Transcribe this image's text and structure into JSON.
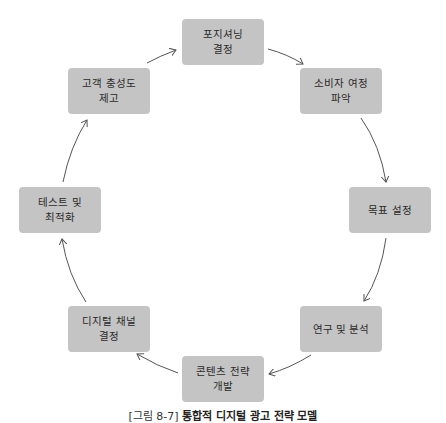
{
  "diagram": {
    "type": "cycle",
    "nodes": [
      {
        "id": "n0",
        "label": "포지셔닝\n결정"
      },
      {
        "id": "n1",
        "label": "소비자 여정\n파악"
      },
      {
        "id": "n2",
        "label": "목표 설정"
      },
      {
        "id": "n3",
        "label": "연구 및 분석"
      },
      {
        "id": "n4",
        "label": "콘텐츠 전략\n개발"
      },
      {
        "id": "n5",
        "label": "디지털 채널\n결정"
      },
      {
        "id": "n6",
        "label": "테스트 및\n최적화"
      },
      {
        "id": "n7",
        "label": "고객 충성도\n제고"
      }
    ],
    "edges": [
      {
        "from": "n7",
        "to": "n0"
      },
      {
        "from": "n0",
        "to": "n1"
      },
      {
        "from": "n1",
        "to": "n2"
      },
      {
        "from": "n2",
        "to": "n3"
      },
      {
        "from": "n3",
        "to": "n4"
      },
      {
        "from": "n4",
        "to": "n5"
      },
      {
        "from": "n5",
        "to": "n6"
      },
      {
        "from": "n6",
        "to": "n7"
      }
    ],
    "colors": {
      "node_fill": "#c4c4c4",
      "node_text": "#2a2a2a",
      "arrow": "#555555"
    }
  },
  "caption": {
    "prefix": "[그림 8-7]",
    "title": "통합적 디지털 광고 전략 모델"
  }
}
